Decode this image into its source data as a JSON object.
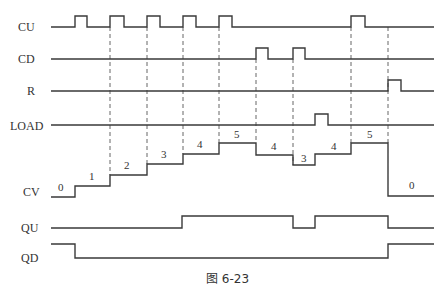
{
  "diagram": {
    "type": "timing-diagram",
    "caption": "图 6-23",
    "signals": [
      {
        "name": "CU",
        "label_y": 27
      },
      {
        "name": "CD",
        "label_y": 59
      },
      {
        "name": "R",
        "label_y": 91
      },
      {
        "name": "LOAD",
        "label_y": 127
      },
      {
        "name": "CV",
        "label_y": 195
      },
      {
        "name": "QU",
        "label_y": 228
      },
      {
        "name": "QD",
        "label_y": 258
      }
    ],
    "cv_values": [
      "0",
      "1",
      "2",
      "3",
      "4",
      "5",
      "4",
      "3",
      "4",
      "5",
      "0"
    ],
    "colors": {
      "line": "#3a3a3a",
      "background": "#ffffff"
    }
  }
}
